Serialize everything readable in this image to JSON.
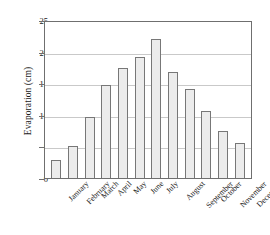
{
  "chart_data": {
    "type": "bar",
    "title": "",
    "xlabel": "",
    "ylabel": "Evaporation (cm)",
    "categories": [
      "January",
      "February",
      "March",
      "April",
      "May",
      "June",
      "July",
      "August",
      "September",
      "October",
      "November",
      "December"
    ],
    "values": [
      2.9,
      5.0,
      9.6,
      14.7,
      17.4,
      19.2,
      22.0,
      16.8,
      14.1,
      10.6,
      7.4,
      5.5
    ],
    "ylim": [
      0,
      25
    ],
    "yticks": [
      0,
      5,
      10,
      15,
      20,
      25
    ],
    "ytick_labels": [
      "0",
      "5",
      "10",
      "15",
      "20",
      "25"
    ],
    "grid": true,
    "legend": false,
    "legend_position": "none",
    "bar_fill_color": "#ececec",
    "bar_edge_color": "#777777",
    "gridline_color": "#c9c9c9",
    "frame_color": "#6f6f6f",
    "background_color": "#ffffff"
  }
}
